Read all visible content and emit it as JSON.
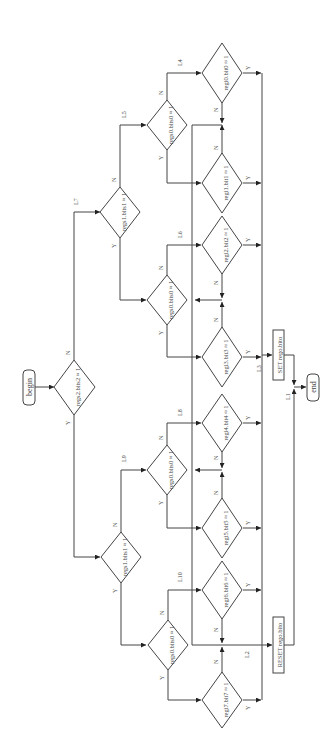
{
  "diagram": {
    "type": "flowchart",
    "orientation": "rotated 90 degrees counterclockwise",
    "terminals": {
      "begin": "begin",
      "end": "end"
    },
    "processes": {
      "set": "SET rego.bito",
      "reset": "RESET rego.bito"
    },
    "decisions": {
      "d_regs2_bits2": "regs2.bits2 ≈ 1",
      "d_regs1_bits1_a": "regs1.bits1 ≈ 1",
      "d_regs1_bits1_b": "regs1.bits1 ≈ 1",
      "d_regs0_bits0_L5": "regs0.bits0 ≈ 1",
      "d_regs0_bits0_L6": "regs0.bits0 ≈ 1",
      "d_regs0_bits0_L9": "regs0.bits0 ≈ 1",
      "d_regs0_bits0_L10": "regs0.bits0 ≈ 1",
      "d_regi_bit0": "regi0.bit0 ≈ 1",
      "d_regi_bit1": "regi1.bit1 ≈ 1",
      "d_regi_bit2": "regi2.bit2 ≈ 1",
      "d_regi_bit3": "regi3.bit3 ≈ 1",
      "d_regi_bit4": "regi4.bit4 ≈ 1",
      "d_regi_bit5": "regi5.bit5 ≈ 1",
      "d_regi_bit6": "regi6.bit6 ≈ 1",
      "d_regi_bit7": "regi7.bit7 ≈ 1"
    },
    "question_mark": "?",
    "branch": {
      "yes": "Y",
      "no": "N"
    },
    "labels": {
      "L1": "L1",
      "L2": "L2",
      "L3": "L3",
      "L4": "L4",
      "L5": "L5",
      "L6": "L6",
      "L7": "L7",
      "L8": "L8",
      "L9": "L9",
      "L10": "L10"
    },
    "colors": {
      "line": "#444444",
      "background": "#ffffff"
    }
  }
}
